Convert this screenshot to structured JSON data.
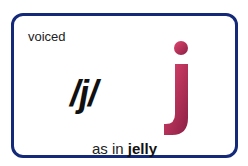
{
  "card": {
    "category": "voiced",
    "phoneme": "/j/",
    "letter": "j",
    "caption_prefix": "as in",
    "caption_word": "jelly"
  },
  "colors": {
    "border": "#142a78",
    "letter": "#c2335a"
  }
}
